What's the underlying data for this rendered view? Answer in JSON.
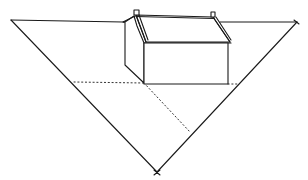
{
  "figure": {
    "type": "perspective line drawing",
    "colors": {
      "line": "#1a1a1a",
      "dotted": "#333333",
      "background": "#ffffff"
    }
  },
  "elements": {
    "triangle": {
      "left": [
        11,
        20
      ],
      "right": [
        297,
        22
      ],
      "bottom": [
        157,
        172
      ]
    },
    "house": {
      "front_face": {
        "x1": 144,
        "y1": 43,
        "x2": 228,
        "y2": 84
      },
      "chimneys": 2
    },
    "construction_lines": {
      "style": "dotted",
      "count": 3
    }
  }
}
